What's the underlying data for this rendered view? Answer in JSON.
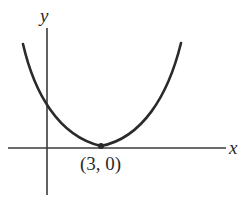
{
  "figure": {
    "type": "function-graph",
    "axes": {
      "x_label": "x",
      "y_label": "y"
    },
    "curve": {
      "kind": "parabola",
      "opens": "up",
      "vertex": [
        3,
        0
      ]
    },
    "points": [
      {
        "label": "(3, 0)",
        "x": 3,
        "y": 0
      }
    ],
    "colors": {
      "stroke": "#2a2a2a",
      "background": "#ffffff"
    }
  }
}
